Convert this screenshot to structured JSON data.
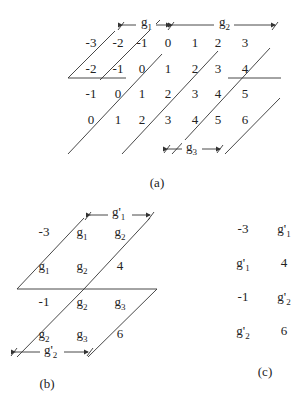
{
  "panel_a": {
    "caption": "(a)",
    "rows": [
      [
        "-3",
        "-2",
        "-1",
        "0",
        "1",
        "2",
        "3"
      ],
      [
        "-2",
        "-1",
        "0",
        "1",
        "2",
        "3",
        "4"
      ],
      [
        "-1",
        "0",
        "1",
        "2",
        "3",
        "4",
        "5"
      ],
      [
        "0",
        "1",
        "2",
        "3",
        "4",
        "5",
        "6"
      ]
    ],
    "arrows": [
      {
        "base": "g",
        "sub": "1"
      },
      {
        "base": "g",
        "sub": "2"
      },
      {
        "base": "g",
        "sub": "3"
      }
    ]
  },
  "panel_b": {
    "caption": "(b)",
    "cells": [
      [
        {
          "base": "-3",
          "sub": ""
        },
        {
          "base": "g",
          "sub": "1"
        },
        {
          "base": "g",
          "sub": "2"
        }
      ],
      [
        {
          "base": "g",
          "sub": "1"
        },
        {
          "base": "g",
          "sub": "2"
        },
        {
          "base": "4",
          "sub": ""
        }
      ],
      [
        {
          "base": "-1",
          "sub": ""
        },
        {
          "base": "g",
          "sub": "2"
        },
        {
          "base": "g",
          "sub": "3"
        }
      ],
      [
        {
          "base": "g",
          "sub": "2"
        },
        {
          "base": "g",
          "sub": "3"
        },
        {
          "base": "6",
          "sub": ""
        }
      ]
    ],
    "arrows": [
      {
        "base": "g'",
        "sub": "1"
      },
      {
        "base": "g'",
        "sub": "2"
      }
    ]
  },
  "panel_c": {
    "caption": "(c)",
    "cells": [
      [
        {
          "base": "-3",
          "sub": ""
        },
        {
          "base": "g'",
          "sub": "1"
        }
      ],
      [
        {
          "base": "g'",
          "sub": "1"
        },
        {
          "base": "4",
          "sub": ""
        }
      ],
      [
        {
          "base": "-1",
          "sub": ""
        },
        {
          "base": "g'",
          "sub": "2"
        }
      ],
      [
        {
          "base": "g'",
          "sub": "2"
        },
        {
          "base": "6",
          "sub": ""
        }
      ]
    ]
  }
}
